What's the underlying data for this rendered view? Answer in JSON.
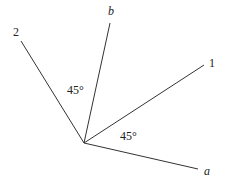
{
  "diagram": {
    "origin": [
      84,
      143
    ],
    "lines": [
      {
        "name": "2",
        "end": [
          21,
          41
        ]
      },
      {
        "name": "b",
        "end": [
          110,
          23
        ]
      },
      {
        "name": "1",
        "end": [
          204,
          65
        ]
      },
      {
        "name": "a",
        "end": [
          198,
          169
        ]
      }
    ],
    "labels": {
      "line_2": "2",
      "line_b": "b",
      "line_1": "1",
      "line_a": "a",
      "angle_upper": "45°",
      "angle_lower": "45°"
    },
    "stroke_color": "#333333"
  }
}
